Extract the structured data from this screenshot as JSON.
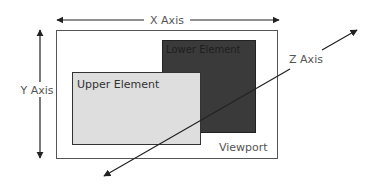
{
  "diagram": {
    "colors": {
      "background": "#ffffff",
      "line": "#222222",
      "viewport_border": "#555555",
      "upper_fill": "#dedede",
      "upper_border": "#333333",
      "lower_fill": "#3a3a3a",
      "lower_border": "#222222",
      "label": "#555555",
      "lower_label": "#1e1e1e"
    },
    "viewport": {
      "label": "Viewport",
      "x": 56,
      "y": 30,
      "w": 221,
      "h": 128
    },
    "lower_element": {
      "label": "Lower Element",
      "x": 162,
      "y": 40,
      "w": 93,
      "h": 92
    },
    "upper_element": {
      "label": "Upper Element",
      "x": 72,
      "y": 72,
      "w": 128,
      "h": 72
    },
    "axes": {
      "x": {
        "label": "X Axis",
        "x1": 56,
        "x2": 279,
        "y": 20,
        "bidirectional": true
      },
      "y": {
        "label": "Y Axis",
        "x": 40,
        "y1": 29,
        "y2": 158,
        "bidirectional": true
      },
      "z": {
        "label": "Z Axis",
        "x1": 104,
        "y1": 176,
        "x2": 357,
        "y2": 30,
        "bidirectional": true
      }
    }
  }
}
